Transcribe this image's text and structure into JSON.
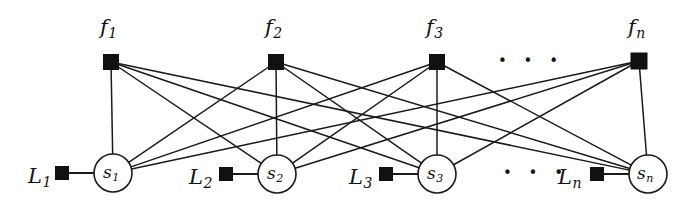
{
  "figure": {
    "type": "factor-graph-diagram",
    "background": "#ffffff",
    "stroke_color": "#1a1a1a",
    "node_fill_square": "#111111",
    "node_fill_circle": "#ffffff",
    "width": 688,
    "height": 209
  },
  "factor_nodes": [
    {
      "id": "f1",
      "label_base": "f",
      "label_sub": "1",
      "x": 111,
      "y": 62,
      "size": 15,
      "label_x": 100,
      "label_y": 17
    },
    {
      "id": "f2",
      "label_base": "f",
      "label_sub": "2",
      "x": 276,
      "y": 62,
      "size": 15,
      "label_x": 265,
      "label_y": 17
    },
    {
      "id": "f3",
      "label_base": "f",
      "label_sub": "3",
      "x": 437,
      "y": 62,
      "size": 15,
      "label_x": 426,
      "label_y": 17
    },
    {
      "id": "fn",
      "label_base": "f",
      "label_sub": "n",
      "x": 639,
      "y": 61,
      "size": 16,
      "label_x": 628,
      "label_y": 17
    }
  ],
  "variable_nodes": [
    {
      "id": "s1",
      "label_base": "s",
      "label_sub": "1",
      "x": 113,
      "y": 173,
      "r": 19,
      "label_x": 103,
      "label_y": 164
    },
    {
      "id": "s2",
      "label_base": "s",
      "label_sub": "2",
      "x": 277,
      "y": 174,
      "r": 19,
      "label_x": 267,
      "label_y": 165
    },
    {
      "id": "s3",
      "label_base": "s",
      "label_sub": "3",
      "x": 437,
      "y": 174,
      "r": 19,
      "label_x": 427,
      "label_y": 165
    },
    {
      "id": "sn",
      "label_base": "s",
      "label_sub": "n",
      "x": 648,
      "y": 174,
      "r": 19,
      "label_x": 637,
      "label_y": 165
    }
  ],
  "observation_nodes": [
    {
      "id": "L1",
      "label_base": "L",
      "label_sub": "1",
      "x": 62,
      "y": 173,
      "size": 13,
      "label_x": 28,
      "label_y": 166,
      "attaches_to": "s1"
    },
    {
      "id": "L2",
      "label_base": "L",
      "label_sub": "2",
      "x": 226,
      "y": 174,
      "size": 13,
      "label_x": 189,
      "label_y": 167,
      "attaches_to": "s2"
    },
    {
      "id": "L3",
      "label_base": "L",
      "label_sub": "3",
      "x": 386,
      "y": 174,
      "size": 13,
      "label_x": 349,
      "label_y": 167,
      "attaches_to": "s3"
    },
    {
      "id": "Ln",
      "label_base": "L",
      "label_sub": "n",
      "x": 597,
      "y": 174,
      "size": 13,
      "label_x": 558,
      "label_y": 167,
      "attaches_to": "sn"
    }
  ],
  "ellipses": [
    {
      "id": "top-ellipsis",
      "text": "• • •",
      "x": 498,
      "y": 54,
      "size": 15
    },
    {
      "id": "bottom-ellipsis",
      "text": "• • •",
      "x": 503,
      "y": 166,
      "size": 15
    }
  ],
  "edges": {
    "description": "complete bipartite connections between every factor node and every variable node",
    "pairs": [
      [
        "f1",
        "s1"
      ],
      [
        "f1",
        "s2"
      ],
      [
        "f1",
        "s3"
      ],
      [
        "f1",
        "sn"
      ],
      [
        "f2",
        "s1"
      ],
      [
        "f2",
        "s2"
      ],
      [
        "f2",
        "s3"
      ],
      [
        "f2",
        "sn"
      ],
      [
        "f3",
        "s1"
      ],
      [
        "f3",
        "s2"
      ],
      [
        "f3",
        "s3"
      ],
      [
        "f3",
        "sn"
      ],
      [
        "fn",
        "s1"
      ],
      [
        "fn",
        "s2"
      ],
      [
        "fn",
        "s3"
      ],
      [
        "fn",
        "sn"
      ]
    ],
    "observation_pairs": [
      [
        "L1",
        "s1"
      ],
      [
        "L2",
        "s2"
      ],
      [
        "L3",
        "s3"
      ],
      [
        "Ln",
        "sn"
      ]
    ]
  }
}
